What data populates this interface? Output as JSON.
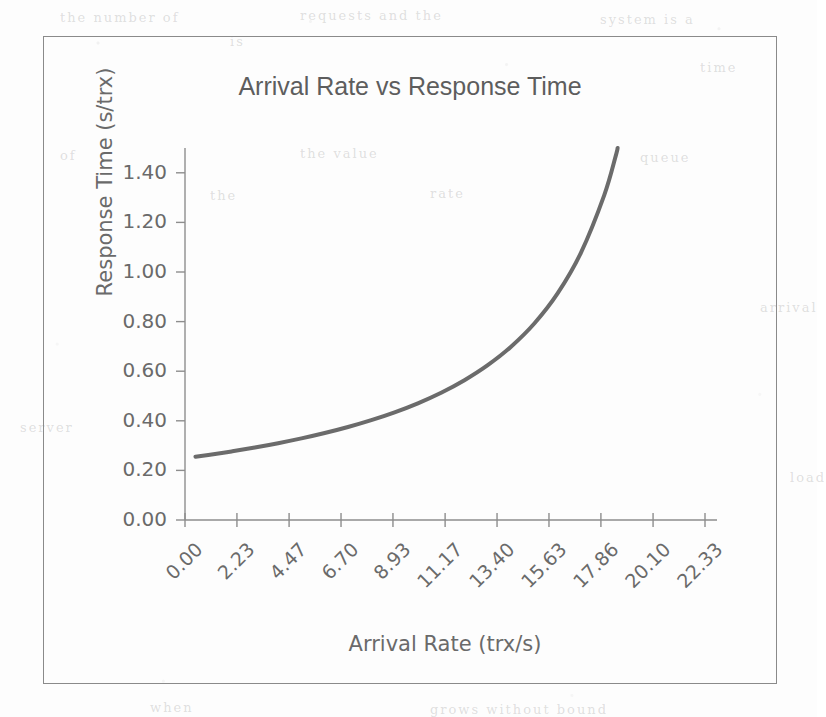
{
  "figure": {
    "frame_border_color": "#8a8a8a",
    "background_color": "#fdfdfd"
  },
  "ghost_text": [
    {
      "text": "the  number  of",
      "x": 60,
      "y": 10
    },
    {
      "text": "requests  and  the",
      "x": 300,
      "y": 8
    },
    {
      "text": "system  is  a",
      "x": 600,
      "y": 12
    },
    {
      "text": "is",
      "x": 230,
      "y": 34
    },
    {
      "text": "time",
      "x": 700,
      "y": 60
    },
    {
      "text": "of",
      "x": 60,
      "y": 148
    },
    {
      "text": "the  value",
      "x": 300,
      "y": 146
    },
    {
      "text": "queue",
      "x": 640,
      "y": 150
    },
    {
      "text": "rate",
      "x": 430,
      "y": 186
    },
    {
      "text": "the",
      "x": 210,
      "y": 188
    },
    {
      "text": "arrival",
      "x": 760,
      "y": 300
    },
    {
      "text": "server",
      "x": 20,
      "y": 420
    },
    {
      "text": "load",
      "x": 790,
      "y": 470
    },
    {
      "text": "when",
      "x": 150,
      "y": 700
    },
    {
      "text": "grows  without  bound",
      "x": 430,
      "y": 702
    }
  ],
  "chart_data": {
    "type": "line",
    "title": "Arrival Rate vs Response Time",
    "xlabel": "Arrival Rate (trx/s)",
    "ylabel": "Response Time (s/trx)",
    "grid": false,
    "legend": null,
    "line_color": "#6b6b6b",
    "line_width": 4,
    "axis_color": "#8d8d8d",
    "xlim": [
      0.0,
      22.33
    ],
    "ylim": [
      0.0,
      1.5
    ],
    "x_ticks": [
      0.0,
      2.23,
      4.47,
      6.7,
      8.93,
      11.17,
      13.4,
      15.63,
      17.86,
      20.1,
      22.33
    ],
    "x_tick_labels": [
      "0.00",
      "2.23",
      "4.47",
      "6.70",
      "8.93",
      "11.17",
      "13.40",
      "15.63",
      "17.86",
      "20.10",
      "22.33"
    ],
    "y_ticks": [
      0.0,
      0.2,
      0.4,
      0.6,
      0.8,
      1.0,
      1.2,
      1.4
    ],
    "y_tick_labels": [
      "0.00",
      "0.20",
      "0.40",
      "0.60",
      "0.80",
      "1.00",
      "1.20",
      "1.40"
    ],
    "model": {
      "description": "M/M/1 response time R = S / (1 - lambda*S)",
      "service_time_s": 0.2495,
      "saturation_rate_trx_per_s": 20.4,
      "x_start": 0.45,
      "x_end": 20.08
    },
    "series": [
      {
        "name": "Response Time",
        "x": [
          0.45,
          1.0,
          2.0,
          3.0,
          4.0,
          5.0,
          6.0,
          7.0,
          8.0,
          9.0,
          10.0,
          11.0,
          12.0,
          13.0,
          14.0,
          15.0,
          16.0,
          17.0,
          18.0,
          18.5,
          19.0,
          19.25,
          19.5,
          19.7,
          19.85,
          19.95,
          20.0,
          20.04,
          20.08
        ],
        "y": [
          0.255,
          0.2624,
          0.2766,
          0.2923,
          0.3097,
          0.329,
          0.3506,
          0.375,
          0.4026,
          0.4342,
          0.4706,
          0.5132,
          0.5637,
          0.6243,
          0.6987,
          0.7923,
          0.9136,
          1.0772,
          1.309,
          1.4693,
          1.6679,
          1.7892,
          1.93,
          2.0612,
          2.1725,
          2.253,
          2.295,
          2.33,
          2.365
        ],
        "y_clipped_at": 1.5,
        "visible_endpoint": {
          "x": 20.08,
          "y": 1.5
        }
      }
    ]
  }
}
